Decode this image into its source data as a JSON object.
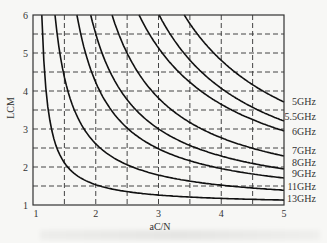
{
  "chart_data": {
    "type": "line",
    "title": "",
    "xlabel": "aC/N",
    "ylabel": "LCM",
    "xlim": [
      1,
      5
    ],
    "ylim": [
      1,
      6
    ],
    "grid": true,
    "grid_style": "dashed",
    "x_ticks": [
      "1",
      "2",
      "3",
      "4",
      "5"
    ],
    "y_ticks": [
      "1",
      "2",
      "3",
      "4",
      "5",
      "6"
    ],
    "x_grid": [
      1.5,
      2,
      2.5,
      3,
      3.5,
      4,
      4.5
    ],
    "y_grid": [
      1.5,
      2,
      2.5,
      3,
      3.5,
      4,
      4.5,
      5,
      5.5
    ],
    "legend_position": "right-inline",
    "x": [
      1.2,
      1.5,
      2,
      2.5,
      3,
      3.5,
      4,
      4.5,
      5
    ],
    "series": [
      {
        "name": "5GHz",
        "a": 1.528,
        "k": 9.41,
        "values": [
          null,
          null,
          null,
          null,
          null,
          5.77,
          4.81,
          4.17,
          3.71
        ]
      },
      {
        "name": "5.5GHz",
        "a": 1.434,
        "k": 7.88,
        "values": [
          null,
          null,
          null,
          null,
          null,
          4.81,
          4.07,
          3.57,
          3.21
        ]
      },
      {
        "name": "6GHz",
        "a": 1.213,
        "k": 7.385,
        "values": [
          null,
          null,
          null,
          null,
          5.13,
          4.23,
          3.65,
          3.25,
          2.95
        ]
      },
      {
        "name": "7GHz",
        "a": 1.307,
        "k": 4.765,
        "values": [
          null,
          null,
          null,
          4.99,
          3.81,
          3.17,
          2.77,
          2.49,
          2.29
        ]
      },
      {
        "name": "8GHz",
        "a": 1.198,
        "k": 3.61,
        "values": [
          null,
          null,
          5.5,
          3.77,
          3.0,
          2.57,
          2.29,
          2.09,
          1.95
        ]
      },
      {
        "name": "9GHz",
        "a": 1.154,
        "k": 2.73,
        "values": [
          null,
          null,
          4.23,
          3.03,
          2.48,
          2.16,
          1.96,
          1.82,
          1.71
        ]
      },
      {
        "name": "11GHz",
        "a": 1.041,
        "k": 1.545,
        "values": [
          null,
          4.37,
          2.61,
          2.06,
          1.79,
          1.63,
          1.52,
          1.45,
          1.39
        ]
      },
      {
        "name": "13GHz",
        "a": 1.037,
        "k": 0.515,
        "values": [
          4.16,
          2.11,
          1.53,
          1.35,
          1.26,
          1.21,
          1.17,
          1.15,
          1.13
        ]
      }
    ],
    "label_y_px": [
      101,
      116,
      131,
      150,
      162,
      173,
      186,
      198
    ]
  }
}
